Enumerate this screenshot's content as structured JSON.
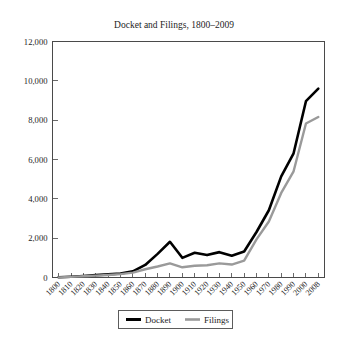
{
  "chart_data": {
    "type": "line",
    "title": "Docket and Filings, 1800–2009",
    "xlabel": "",
    "ylabel": "",
    "grid": false,
    "legend_position": "bottom-center",
    "ylim": [
      0,
      12000
    ],
    "yticks": [
      0,
      2000,
      4000,
      6000,
      8000,
      10000,
      12000
    ],
    "ytick_labels": [
      "0",
      "2,000",
      "4,000",
      "6,000",
      "8,000",
      "10,000",
      "12,000"
    ],
    "x": [
      1800,
      1810,
      1820,
      1830,
      1840,
      1850,
      1860,
      1870,
      1880,
      1890,
      1900,
      1910,
      1920,
      1930,
      1940,
      1950,
      1960,
      1970,
      1980,
      1990,
      2000,
      2008
    ],
    "xtick_labels": [
      "1800",
      "1810",
      "1820",
      "1830",
      "1840",
      "1850",
      "1860",
      "1870",
      "1880",
      "1890",
      "1900",
      "1910",
      "1920",
      "1930",
      "1940",
      "1950",
      "1960",
      "1970",
      "1980",
      "1990",
      "2000",
      "2008"
    ],
    "series": [
      {
        "name": "Docket",
        "color": "#000000",
        "width": 2.6,
        "values": [
          10,
          40,
          80,
          120,
          160,
          200,
          310,
          640,
          1200,
          1816,
          1000,
          1260,
          1140,
          1290,
          1110,
          1320,
          2313,
          3419,
          5144,
          6316,
          8965,
          9602
        ]
      },
      {
        "name": "Filings",
        "color": "#9a9a9a",
        "width": 2.4,
        "values": [
          8,
          30,
          60,
          95,
          130,
          170,
          250,
          420,
          560,
          720,
          520,
          600,
          620,
          720,
          660,
          860,
          1940,
          2850,
          4300,
          5400,
          7830,
          8159
        ]
      }
    ]
  },
  "legend": {
    "items": [
      {
        "label": "Docket",
        "color": "#000000"
      },
      {
        "label": "Filings",
        "color": "#9a9a9a"
      }
    ]
  }
}
